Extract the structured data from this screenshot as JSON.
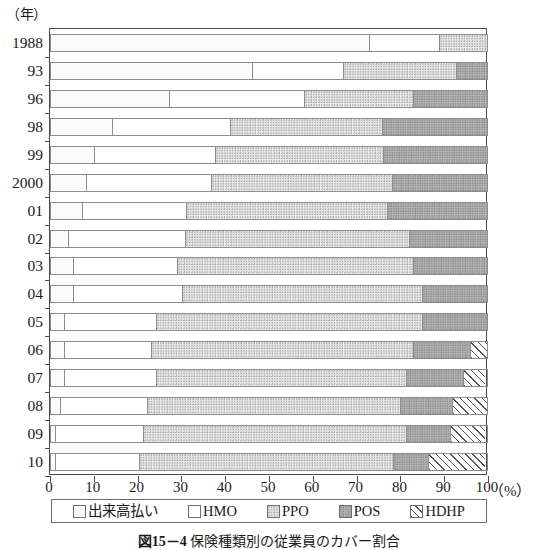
{
  "axis_unit_y": "（年）",
  "axis_unit_x": "（%）",
  "caption": {
    "figure_no": "図15－4",
    "text": "保険種類別の従業員のカバー割合"
  },
  "legend": {
    "position": "bottom",
    "items": [
      {
        "label": "出来高払い",
        "pattern": "fine-dot-light",
        "color": "#fbfbfb"
      },
      {
        "label": "HMO",
        "pattern": "solid-white",
        "color": "#ffffff"
      },
      {
        "label": "PPO",
        "pattern": "dot-medium",
        "color": "#ededed"
      },
      {
        "label": "POS",
        "pattern": "dot-dark",
        "color": "#b4b4b4"
      },
      {
        "label": "HDHP",
        "pattern": "diagonal-hatch",
        "color": "#ffffff"
      }
    ]
  },
  "chart_data": {
    "type": "bar",
    "orientation": "horizontal",
    "stacked": true,
    "normalized": true,
    "title": "保険種類別の従業員のカバー割合",
    "xlabel": "（%）",
    "ylabel": "（年）",
    "xlim": [
      0,
      100
    ],
    "xticks": [
      0,
      10,
      20,
      30,
      40,
      50,
      60,
      70,
      80,
      90,
      100
    ],
    "xtick_labels": [
      "0",
      "10",
      "20",
      "30",
      "40",
      "50",
      "60",
      "70",
      "80",
      "90",
      "100"
    ],
    "grid": false,
    "legend_position": "bottom",
    "categories": [
      "1988",
      "93",
      "96",
      "98",
      "99",
      "2000",
      "01",
      "02",
      "03",
      "04",
      "05",
      "06",
      "07",
      "08",
      "09",
      "10"
    ],
    "series": [
      {
        "name": "出来高払い",
        "values": [
          73,
          46,
          27,
          14,
          10,
          8,
          7,
          4,
          5,
          5,
          3,
          3,
          3,
          2,
          1,
          1
        ]
      },
      {
        "name": "HMO",
        "values": [
          16,
          21,
          31,
          27,
          28,
          29,
          24,
          27,
          24,
          25,
          21,
          20,
          21,
          20,
          20,
          19
        ]
      },
      {
        "name": "PPO",
        "values": [
          11,
          26,
          25,
          35,
          39,
          42,
          46,
          52,
          54,
          55,
          61,
          60,
          57,
          58,
          60,
          58
        ]
      },
      {
        "name": "POS",
        "values": [
          0,
          7,
          17,
          24,
          24,
          22,
          23,
          18,
          17,
          15,
          15,
          13,
          13,
          12,
          10,
          8
        ]
      },
      {
        "name": "HDHP",
        "values": [
          0,
          0,
          0,
          0,
          0,
          0,
          0,
          0,
          0,
          0,
          0,
          4,
          5,
          8,
          8,
          13
        ]
      }
    ],
    "cumulative_boundaries": [
      {
        "year": "1988",
        "stops": [
          73,
          89,
          100,
          100,
          100
        ]
      },
      {
        "year": "93",
        "stops": [
          46,
          67,
          93,
          100,
          100
        ]
      },
      {
        "year": "96",
        "stops": [
          27,
          58,
          83,
          100,
          100
        ]
      },
      {
        "year": "98",
        "stops": [
          14,
          41,
          76,
          100,
          100
        ]
      },
      {
        "year": "99",
        "stops": [
          10,
          38,
          77,
          100,
          100
        ]
      },
      {
        "year": "2000",
        "stops": [
          8,
          37,
          78,
          100,
          100
        ]
      },
      {
        "year": "01",
        "stops": [
          7,
          31,
          77,
          100,
          100
        ]
      },
      {
        "year": "02",
        "stops": [
          4,
          31,
          82,
          100,
          100
        ]
      },
      {
        "year": "03",
        "stops": [
          5,
          29,
          83,
          100,
          100
        ]
      },
      {
        "year": "04",
        "stops": [
          5,
          30,
          85,
          100,
          100
        ]
      },
      {
        "year": "05",
        "stops": [
          3,
          24,
          85,
          100,
          100
        ]
      },
      {
        "year": "06",
        "stops": [
          3,
          23,
          83,
          96,
          100
        ]
      },
      {
        "year": "07",
        "stops": [
          3,
          24,
          81,
          94,
          100
        ]
      },
      {
        "year": "08",
        "stops": [
          2,
          22,
          80,
          92,
          100
        ]
      },
      {
        "year": "09",
        "stops": [
          1,
          21,
          81,
          91,
          100
        ]
      },
      {
        "year": "10",
        "stops": [
          1,
          20,
          78,
          86,
          100
        ]
      }
    ]
  }
}
